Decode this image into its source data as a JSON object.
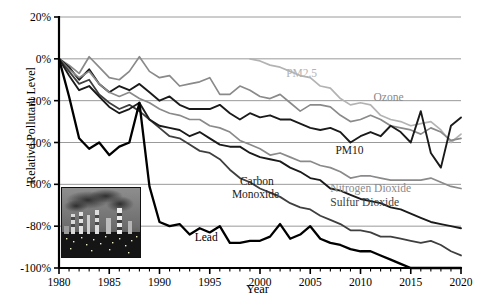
{
  "chart_data": {
    "type": "line",
    "title": "",
    "xlabel": "Year",
    "ylabel": "Relative Pollutant Level",
    "xlim": [
      1980,
      2020
    ],
    "ylim": [
      -100,
      20
    ],
    "yticks": [
      "20%",
      "0%",
      "-20%",
      "-40%",
      "-60%",
      "-80%",
      "-100%"
    ],
    "ytick_values": [
      20,
      0,
      -20,
      -40,
      -60,
      -80,
      -100
    ],
    "xticks": [
      "1980",
      "1985",
      "1990",
      "1995",
      "2000",
      "2005",
      "2010",
      "2015",
      "2020"
    ],
    "xtick_values": [
      1980,
      1985,
      1990,
      1995,
      2000,
      2005,
      2010,
      2015,
      2020
    ],
    "xminor_step": 1,
    "grid": "horizontal",
    "legend": "inline-annotations",
    "units": "percent change relative to 1980",
    "series": [
      {
        "name": "PM2.5",
        "label": "PM2.5",
        "color": "#b3b3b3",
        "width": 1.7,
        "label_x": 2002.6,
        "label_y": -8.5,
        "x": [
          1999,
          2000,
          2001,
          2002,
          2003,
          2004,
          2005,
          2006,
          2007,
          2008,
          2009,
          2010,
          2011,
          2012,
          2013,
          2014,
          2015,
          2016,
          2017,
          2018,
          2019,
          2020
        ],
        "values": [
          0,
          -1,
          -3,
          -4,
          -6,
          -8,
          -9,
          -13,
          -14,
          -19,
          -22,
          -21,
          -22,
          -27,
          -29,
          -30,
          -32,
          -31,
          -30,
          -34,
          -40,
          -36
        ]
      },
      {
        "name": "Ozone",
        "label": "Ozone",
        "color": "#8a8a8a",
        "width": 1.7,
        "label_x": 2011.3,
        "label_y": -20.0,
        "x": [
          1980,
          1981,
          1982,
          1983,
          1984,
          1985,
          1986,
          1987,
          1988,
          1989,
          1990,
          1991,
          1992,
          1993,
          1994,
          1995,
          1996,
          1997,
          1998,
          1999,
          2000,
          2001,
          2002,
          2003,
          2004,
          2005,
          2006,
          2007,
          2008,
          2009,
          2010,
          2011,
          2012,
          2013,
          2014,
          2015,
          2016,
          2017,
          2018,
          2019,
          2020
        ],
        "values": [
          0,
          -3,
          -7,
          1,
          -4,
          -9,
          -10,
          -6,
          1,
          -6,
          -9,
          -8,
          -13,
          -12,
          -11,
          -9,
          -17,
          -17,
          -13,
          -15,
          -18,
          -19,
          -17,
          -21,
          -25,
          -22,
          -22,
          -23,
          -27,
          -30,
          -29,
          -27,
          -29,
          -32,
          -33,
          -34,
          -36,
          -33,
          -35,
          -39,
          -38
        ]
      },
      {
        "name": "PM10",
        "label": "PM10",
        "color": "#1a1a1a",
        "width": 1.9,
        "label_x": 2007.5,
        "label_y": -45.5,
        "x": [
          1980,
          1981,
          1982,
          1983,
          1984,
          1985,
          1986,
          1987,
          1988,
          1989,
          1990,
          1991,
          1992,
          1993,
          1994,
          1995,
          1996,
          1997,
          1998,
          1999,
          2000,
          2001,
          2002,
          2003,
          2004,
          2005,
          2006,
          2007,
          2008,
          2009,
          2010,
          2011,
          2012,
          2013,
          2014,
          2015,
          2016,
          2017,
          2018,
          2019,
          2020
        ],
        "values": [
          0,
          -4,
          -10,
          -5,
          -12,
          -16,
          -13,
          -15,
          -12,
          -16,
          -20,
          -18,
          -22,
          -24,
          -24,
          -24,
          -22,
          -26,
          -29,
          -26,
          -28,
          -27,
          -29,
          -29,
          -31,
          -33,
          -34,
          -33,
          -35,
          -40,
          -37,
          -35,
          -37,
          -32,
          -35,
          -40,
          -25,
          -45,
          -52,
          -32,
          -28
        ]
      },
      {
        "name": "Nitrogen Dioxide",
        "label": "Nitrogen Dioxide",
        "color": "#8a8a8a",
        "width": 1.7,
        "label_x": 2007.0,
        "label_y": -63.5,
        "x": [
          1980,
          1981,
          1982,
          1983,
          1984,
          1985,
          1986,
          1987,
          1988,
          1989,
          1990,
          1991,
          1992,
          1993,
          1994,
          1995,
          1996,
          1997,
          1998,
          1999,
          2000,
          2001,
          2002,
          2003,
          2004,
          2005,
          2006,
          2007,
          2008,
          2009,
          2010,
          2011,
          2012,
          2013,
          2014,
          2015,
          2016,
          2017,
          2018,
          2019,
          2020
        ],
        "values": [
          0,
          -5,
          -9,
          -6,
          -12,
          -16,
          -18,
          -16,
          -19,
          -21,
          -24,
          -26,
          -27,
          -29,
          -29,
          -32,
          -33,
          -35,
          -39,
          -41,
          -43,
          -46,
          -45,
          -47,
          -49,
          -49,
          -51,
          -52,
          -54,
          -57,
          -56,
          -56,
          -57,
          -58,
          -58,
          -58,
          -58,
          -57,
          -59,
          -61,
          -62
        ]
      },
      {
        "name": "Sulfur Dioxide",
        "label": "Sulfur Dioxide",
        "color": "#3f3f3f",
        "width": 1.8,
        "label_x": 2007.0,
        "label_y": -70.5,
        "x": [
          1980,
          1981,
          1982,
          1983,
          1984,
          1985,
          1986,
          1987,
          1988,
          1989,
          1990,
          1991,
          1992,
          1993,
          1994,
          1995,
          1996,
          1997,
          1998,
          1999,
          2000,
          2001,
          2002,
          2003,
          2004,
          2005,
          2006,
          2007,
          2008,
          2009,
          2010,
          2011,
          2012,
          2013,
          2014,
          2015,
          2016,
          2017,
          2018,
          2019,
          2020
        ],
        "values": [
          0,
          -6,
          -12,
          -10,
          -17,
          -21,
          -24,
          -22,
          -25,
          -29,
          -33,
          -37,
          -38,
          -41,
          -44,
          -45,
          -48,
          -53,
          -57,
          -59,
          -62,
          -64,
          -66,
          -69,
          -71,
          -72,
          -75,
          -77,
          -79,
          -82,
          -82,
          -83,
          -85,
          -85,
          -86,
          -87,
          -88,
          -87,
          -89,
          -92,
          -94
        ]
      },
      {
        "name": "Carbon Monoxide",
        "label": "Carbon Monoxide",
        "color": "#1a1a1a",
        "width": 1.9,
        "label_x": 1998.0,
        "label_y": -60.5,
        "x": [
          1980,
          1981,
          1982,
          1983,
          1984,
          1985,
          1986,
          1987,
          1988,
          1989,
          1990,
          1991,
          1992,
          1993,
          1994,
          1995,
          1996,
          1997,
          1998,
          1999,
          2000,
          2001,
          2002,
          2003,
          2004,
          2005,
          2006,
          2007,
          2008,
          2009,
          2010,
          2011,
          2012,
          2013,
          2014,
          2015,
          2016,
          2017,
          2018,
          2019,
          2020
        ],
        "values": [
          0,
          -8,
          -15,
          -13,
          -18,
          -23,
          -26,
          -24,
          -21,
          -29,
          -32,
          -33,
          -34,
          -37,
          -35,
          -38,
          -41,
          -42,
          -42,
          -45,
          -47,
          -48,
          -49,
          -52,
          -54,
          -57,
          -58,
          -62,
          -63,
          -65,
          -67,
          -68,
          -69,
          -71,
          -72,
          -74,
          -76,
          -78,
          -79,
          -80,
          -81
        ]
      },
      {
        "name": "Lead",
        "label": "Lead",
        "color": "#000000",
        "width": 2.3,
        "label_x": 1993.5,
        "label_y": -87.0,
        "x": [
          1980,
          1981,
          1982,
          1983,
          1984,
          1985,
          1986,
          1987,
          1988,
          1989,
          1990,
          1991,
          1992,
          1993,
          1994,
          1995,
          1996,
          1997,
          1998,
          1999,
          2000,
          2001,
          2002,
          2003,
          2004,
          2005,
          2006,
          2007,
          2008,
          2009,
          2010,
          2011,
          2012,
          2013,
          2014,
          2015,
          2016,
          2017,
          2018,
          2019,
          2020
        ],
        "values": [
          0,
          -18,
          -38,
          -43,
          -40,
          -46,
          -42,
          -40,
          -21,
          -61,
          -78,
          -80,
          -79,
          -84,
          -81,
          -83,
          -80,
          -88,
          -88,
          -87,
          -87,
          -85,
          -79,
          -86,
          -84,
          -80,
          -86,
          -88,
          -89,
          -91,
          -92,
          -92,
          -94,
          -96,
          -98,
          -100,
          -100,
          -100,
          -100,
          -100,
          -100
        ]
      }
    ]
  },
  "inset": {
    "name": "industrial-smokestacks-photo",
    "alt": "Industrial plant with smokestacks emitting smoke"
  }
}
